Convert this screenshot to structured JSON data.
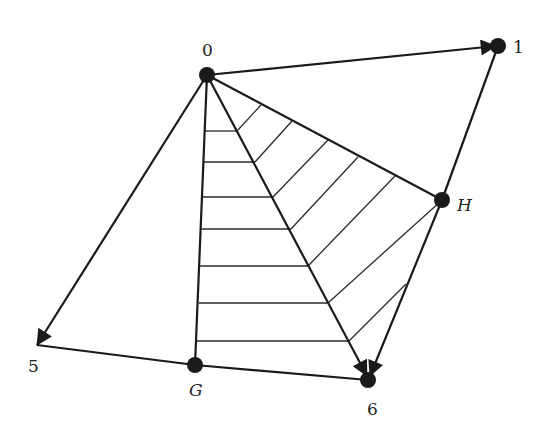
{
  "diagram": {
    "type": "directed graph with hatched triangular regions",
    "nodes": [
      {
        "id": "0",
        "label": "0",
        "x": 207,
        "y": 75,
        "dot": true
      },
      {
        "id": "1",
        "label": "1",
        "x": 498,
        "y": 46,
        "dot": true
      },
      {
        "id": "H",
        "label": "H",
        "x": 442,
        "y": 200,
        "dot": true,
        "italic": true
      },
      {
        "id": "5",
        "label": "5",
        "x": 37,
        "y": 345,
        "dot": false
      },
      {
        "id": "G",
        "label": "G",
        "x": 195,
        "y": 365,
        "dot": true,
        "italic": true
      },
      {
        "id": "6",
        "label": "6",
        "x": 368,
        "y": 380,
        "dot": true
      }
    ],
    "labels": {
      "n0": "0",
      "n1": "1",
      "nH": "H",
      "n5": "5",
      "nG": "G",
      "n6": "6"
    },
    "edges": [
      {
        "from": "0",
        "to": "1",
        "directed": true
      },
      {
        "from": "0",
        "to": "5",
        "directed": true
      },
      {
        "from": "0",
        "to": "6",
        "directed": true
      },
      {
        "from": "1",
        "to": "6",
        "directed": true,
        "via": "H"
      },
      {
        "from": "0",
        "to": "G",
        "directed": false
      },
      {
        "from": "0",
        "to": "H",
        "directed": false
      },
      {
        "from": "5",
        "to": "G",
        "directed": false
      },
      {
        "from": "G",
        "to": "6",
        "directed": false
      }
    ],
    "hatched_regions": [
      {
        "triangle": [
          "0",
          "G",
          "6"
        ],
        "hatch": "horizontal",
        "line_count": 7
      },
      {
        "triangle": [
          "0",
          "6",
          "H"
        ],
        "hatch": "diagonal",
        "line_count": 7
      }
    ],
    "colors": {
      "stroke": "#1a1a1a",
      "background": "#ffffff"
    }
  }
}
